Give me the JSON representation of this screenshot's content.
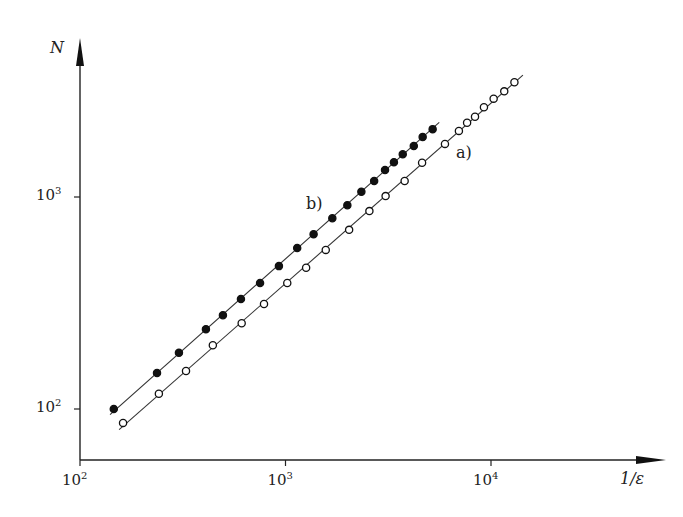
{
  "chart_data": {
    "type": "scatter",
    "title": "",
    "xlabel": "1/ε",
    "ylabel": "N",
    "xscale": "log",
    "yscale": "log",
    "xlim": [
      100,
      20000
    ],
    "ylim": [
      60,
      4500
    ],
    "x_ticks": [
      {
        "base": "10",
        "exp": "2",
        "value": 100
      },
      {
        "base": "10",
        "exp": "3",
        "value": 1000
      },
      {
        "base": "10",
        "exp": "4",
        "value": 10000
      }
    ],
    "y_ticks": [
      {
        "base": "10",
        "exp": "2",
        "value": 100
      },
      {
        "base": "10",
        "exp": "3",
        "value": 1000
      }
    ],
    "grid": false,
    "legend": "none (inline curve labels)",
    "series": [
      {
        "name": "b)",
        "marker": "filled-circle",
        "x": [
          146,
          237,
          303,
          410,
          496,
          607,
          752,
          929,
          1140,
          1370,
          1690,
          2000,
          2340,
          2700,
          3050,
          3370,
          3720,
          4210,
          4650,
          5200
        ],
        "y": [
          100,
          148,
          184,
          238,
          277,
          330,
          393,
          472,
          574,
          668,
          794,
          915,
          1060,
          1190,
          1340,
          1460,
          1590,
          1740,
          1920,
          2090
        ],
        "fit_line": {
          "x": [
            140,
            5600
          ],
          "y": [
            94,
            2250
          ]
        }
      },
      {
        "name": "a)",
        "marker": "open-circle",
        "x": [
          162,
          242,
          328,
          443,
          612,
          786,
          1020,
          1260,
          1570,
          2040,
          2560,
          3070,
          3800,
          4620,
          5970,
          6980,
          7650,
          8360,
          9240,
          10300,
          11600,
          13000
        ],
        "y": [
          86,
          118,
          151,
          200,
          254,
          313,
          393,
          464,
          563,
          700,
          858,
          1010,
          1190,
          1450,
          1780,
          2050,
          2240,
          2390,
          2650,
          2910,
          3150,
          3480
        ],
        "fit_line": {
          "x": [
            155,
            14300
          ],
          "y": [
            80,
            3760
          ]
        }
      }
    ],
    "annotations": [
      {
        "text": "b)",
        "near_series": "b)"
      },
      {
        "text": "a)",
        "near_series": "a)"
      }
    ]
  },
  "labels": {
    "y_axis": "N",
    "x_axis": "1/ε",
    "curve_a": "a)",
    "curve_b": "b)",
    "tick_base": "10"
  }
}
